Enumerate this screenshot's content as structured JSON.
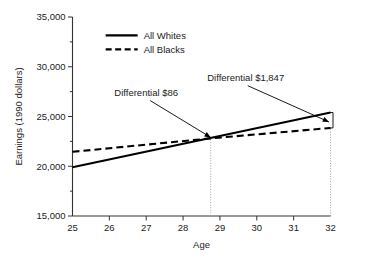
{
  "chart_data": {
    "type": "line",
    "title": "",
    "xlabel": "Age",
    "ylabel": "Earnings (1990 dollars)",
    "xlim": [
      25,
      32
    ],
    "ylim": [
      15000,
      35000
    ],
    "xticks": [
      25,
      26,
      27,
      28,
      29,
      30,
      31,
      32
    ],
    "xtick_labels": [
      "25",
      "26",
      "27",
      "28",
      "29",
      "30",
      "31",
      "32"
    ],
    "yticks": [
      15000,
      20000,
      25000,
      30000,
      35000
    ],
    "ytick_labels": [
      "15,000",
      "20,000",
      "25,000",
      "30,000",
      "35,000"
    ],
    "grid": false,
    "legend_position": "top-center",
    "series": [
      {
        "name": "All Whites",
        "style": "solid",
        "color": "#000000",
        "x": [
          25,
          32
        ],
        "values": [
          19900,
          25400
        ]
      },
      {
        "name": "All Blacks",
        "style": "dashed",
        "color": "#000000",
        "x": [
          25,
          28.75,
          32
        ],
        "values": [
          21450,
          22800,
          23850
        ]
      }
    ],
    "annotations": [
      {
        "label": "Differential $86",
        "text_x": 27.0,
        "text_y": 27100,
        "target_x": 28.75,
        "target_y": 22800
      },
      {
        "label": "Differential $1,847",
        "text_x": 29.7,
        "text_y": 28600,
        "target_x": 32.0,
        "target_y": 24450
      }
    ],
    "guides": [
      {
        "x": 28.75,
        "from_y": 15000,
        "to_y": 22800
      },
      {
        "x": 32.0,
        "from_y": 15000,
        "to_y": 23850
      }
    ]
  },
  "legend": {
    "items": [
      {
        "label": "All Whites",
        "style": "solid"
      },
      {
        "label": "All Blacks",
        "style": "dashed"
      }
    ]
  },
  "axes": {
    "x_title": "Age",
    "y_title": "Earnings (1990 dollars)"
  }
}
